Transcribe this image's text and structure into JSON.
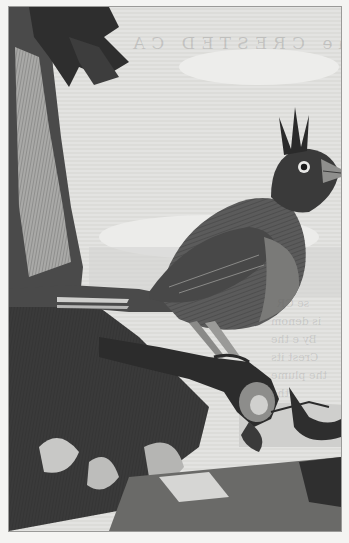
{
  "plate": {
    "subject": "Crested bird perched on a gnarled branch beside a tree trunk",
    "style": "monochrome copperplate engraving",
    "colors": {
      "paper": "#f4f4f2",
      "plate_bg": "#e6e6e4",
      "ink_dark": "#2a2a2a",
      "ink_mid": "#5a5a5a",
      "ink_light": "#9a9a98",
      "sky": "#dcdcda"
    }
  },
  "showthrough": {
    "title": "The CRESTED CA",
    "lines": [
      "se CR",
      "is denom",
      "By e the",
      "Crest its",
      "the plume",
      "the"
    ]
  }
}
